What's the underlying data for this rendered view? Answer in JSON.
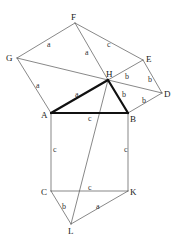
{
  "diagram": {
    "points": {
      "F": {
        "x": 75,
        "y": 23
      },
      "G": {
        "x": 17,
        "y": 58
      },
      "E": {
        "x": 143,
        "y": 60
      },
      "H": {
        "x": 108,
        "y": 80
      },
      "D": {
        "x": 162,
        "y": 93
      },
      "A": {
        "x": 51,
        "y": 113
      },
      "B": {
        "x": 128,
        "y": 113
      },
      "C": {
        "x": 51,
        "y": 191
      },
      "K": {
        "x": 128,
        "y": 191
      },
      "L": {
        "x": 71,
        "y": 224
      }
    },
    "vertex_labels": [
      {
        "name": "F",
        "text": "F",
        "x": 71,
        "y": 20
      },
      {
        "name": "G",
        "text": "G",
        "x": 6,
        "y": 61
      },
      {
        "name": "E",
        "text": "E",
        "x": 146,
        "y": 62
      },
      {
        "name": "H",
        "text": "H",
        "x": 106,
        "y": 77
      },
      {
        "name": "D",
        "text": "D",
        "x": 164,
        "y": 97
      },
      {
        "name": "A",
        "text": "A",
        "x": 41,
        "y": 118
      },
      {
        "name": "B",
        "text": "B",
        "x": 130,
        "y": 122
      },
      {
        "name": "C",
        "text": "C",
        "x": 41,
        "y": 195
      },
      {
        "name": "K",
        "text": "K",
        "x": 130,
        "y": 195
      },
      {
        "name": "L",
        "text": "L",
        "x": 68,
        "y": 234
      }
    ],
    "edges": [
      {
        "from": "F",
        "to": "G",
        "label": "a",
        "lx": 47,
        "ly": 47,
        "thick": false
      },
      {
        "from": "F",
        "to": "E",
        "label": "c",
        "lx": 107,
        "ly": 47,
        "thick": false
      },
      {
        "from": "F",
        "to": "H",
        "label": "a",
        "lx": 85,
        "ly": 55,
        "thick": false
      },
      {
        "from": "G",
        "to": "D",
        "label": "",
        "lx": 0,
        "ly": 0,
        "thick": false
      },
      {
        "from": "G",
        "to": "A",
        "label": "a",
        "lx": 36,
        "ly": 88,
        "thick": false
      },
      {
        "from": "H",
        "to": "E",
        "label": "b",
        "lx": 125,
        "ly": 79,
        "thick": false
      },
      {
        "from": "E",
        "to": "D",
        "label": "b",
        "lx": 148,
        "ly": 82,
        "thick": false
      },
      {
        "from": "B",
        "to": "D",
        "label": "b",
        "lx": 142,
        "ly": 103,
        "thick": false
      },
      {
        "from": "A",
        "to": "H",
        "label": "a",
        "lx": 75,
        "ly": 97,
        "thick": true
      },
      {
        "from": "H",
        "to": "B",
        "label": "b",
        "lx": 122,
        "ly": 97,
        "thick": true
      },
      {
        "from": "A",
        "to": "B",
        "label": "c",
        "lx": 88,
        "ly": 121,
        "thick": true
      },
      {
        "from": "A",
        "to": "C",
        "label": "c",
        "lx": 53,
        "ly": 152,
        "thick": false
      },
      {
        "from": "B",
        "to": "K",
        "label": "c",
        "lx": 124,
        "ly": 152,
        "thick": false
      },
      {
        "from": "C",
        "to": "K",
        "label": "c",
        "lx": 88,
        "ly": 190,
        "thick": false
      },
      {
        "from": "C",
        "to": "L",
        "label": "b",
        "lx": 62,
        "ly": 209,
        "thick": false
      },
      {
        "from": "K",
        "to": "L",
        "label": "a",
        "lx": 96,
        "ly": 209,
        "thick": false
      },
      {
        "from": "H",
        "to": "L",
        "label": "",
        "lx": 0,
        "ly": 0,
        "thick": false
      }
    ],
    "colors": {
      "background": "#ffffff",
      "thin_line": "#555555",
      "thick_line": "#111111",
      "text": "#222222"
    }
  }
}
